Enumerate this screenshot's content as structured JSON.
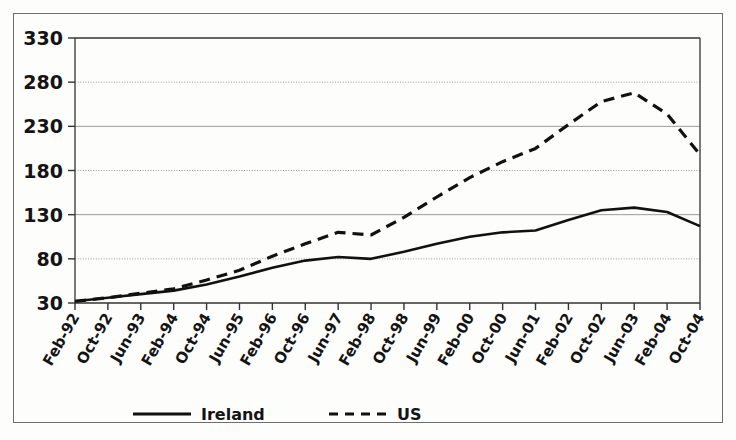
{
  "chart_data": {
    "type": "line",
    "title": "",
    "xlabel": "",
    "ylabel": "",
    "ylim": [
      30,
      330
    ],
    "yticks": [
      30,
      80,
      130,
      180,
      230,
      280,
      330
    ],
    "grid": true,
    "legend_position": "bottom",
    "categories": [
      "Feb-92",
      "Oct-92",
      "Jun-93",
      "Feb-94",
      "Oct-94",
      "Jun-95",
      "Feb-96",
      "Oct-96",
      "Jun-97",
      "Feb-98",
      "Oct-98",
      "Jun-99",
      "Feb-00",
      "Oct-00",
      "Jun-01",
      "Feb-02",
      "Oct-02",
      "Jun-03",
      "Feb-04",
      "Oct-04"
    ],
    "series": [
      {
        "name": "Ireland",
        "style": "solid",
        "color": "#111111",
        "values": [
          32,
          36,
          40,
          44,
          51,
          60,
          70,
          78,
          82,
          80,
          88,
          97,
          105,
          110,
          112,
          124,
          135,
          138,
          133,
          117
        ]
      },
      {
        "name": "US",
        "style": "dashed",
        "color": "#111111",
        "values": [
          32,
          36,
          41,
          46,
          56,
          67,
          83,
          97,
          110,
          107,
          127,
          150,
          172,
          190,
          205,
          232,
          258,
          268,
          244,
          198
        ]
      }
    ]
  },
  "axis": {
    "y_tick_labels": [
      "330",
      "280",
      "230",
      "180",
      "130",
      "80",
      "30"
    ],
    "x_tick_labels": [
      "Feb-92",
      "Oct-92",
      "Jun-93",
      "Feb-94",
      "Oct-94",
      "Jun-95",
      "Feb-96",
      "Oct-96",
      "Jun-97",
      "Feb-98",
      "Oct-98",
      "Jun-99",
      "Feb-00",
      "Oct-00",
      "Jun-01",
      "Feb-02",
      "Oct-02",
      "Jun-03",
      "Feb-04",
      "Oct-04"
    ]
  },
  "legend": {
    "entries": [
      {
        "label": "Ireland",
        "style": "solid"
      },
      {
        "label": "US",
        "style": "dashed"
      }
    ]
  },
  "colors": {
    "line": "#111111",
    "grid": "#9a9a9a",
    "axis": "#333333",
    "frame": "#6e6e6e",
    "background": "#fdfdfc",
    "text": "#141414"
  }
}
